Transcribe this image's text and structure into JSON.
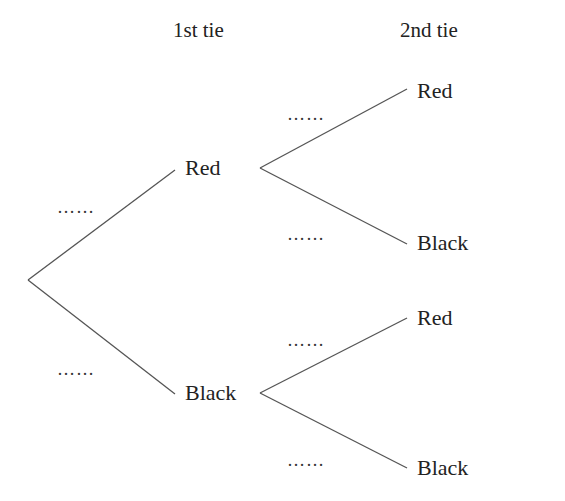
{
  "headers": {
    "first": "1st tie",
    "second": "2nd tie"
  },
  "first_level": [
    {
      "label": "Red",
      "probability_placeholder": "……"
    },
    {
      "label": "Black",
      "probability_placeholder": "……"
    }
  ],
  "second_level": {
    "from_red": [
      {
        "label": "Red",
        "probability_placeholder": "……"
      },
      {
        "label": "Black",
        "probability_placeholder": "……"
      }
    ],
    "from_black": [
      {
        "label": "Red",
        "probability_placeholder": "……"
      },
      {
        "label": "Black",
        "probability_placeholder": "……"
      }
    ]
  },
  "colors": {
    "line": "#555555",
    "text": "#222222",
    "background": "#ffffff"
  }
}
